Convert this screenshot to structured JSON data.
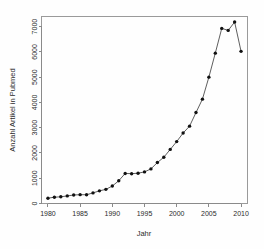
{
  "chart_data": {
    "type": "line",
    "title": "",
    "xlabel": "Jahr",
    "ylabel": "Anzahl Artikel in Pubmed",
    "xlim": [
      1979,
      2011
    ],
    "ylim": [
      0,
      7400
    ],
    "xticks": [
      1980,
      1985,
      1990,
      1995,
      2000,
      2005,
      2010
    ],
    "yticks": [
      0,
      1000,
      2000,
      3000,
      4000,
      5000,
      6000,
      7000
    ],
    "xtick_labels": [
      "1980",
      "1985",
      "1990",
      "1995",
      "2000",
      "2005",
      "2010"
    ],
    "ytick_labels": [
      "0",
      "1000",
      "2000",
      "3000",
      "4000",
      "5000",
      "6000",
      "7000"
    ],
    "grid": false,
    "legend": "none",
    "marker": "filled-circle",
    "line_color": "#1a1a1a",
    "point_color": "#111111",
    "x": [
      1980,
      1981,
      1982,
      1983,
      1984,
      1985,
      1986,
      1987,
      1988,
      1989,
      1990,
      1991,
      1992,
      1993,
      1994,
      1995,
      1996,
      1997,
      1998,
      1999,
      2000,
      2001,
      2002,
      2003,
      2004,
      2005,
      2006,
      2007,
      2008,
      2009,
      2010
    ],
    "values": [
      210,
      250,
      265,
      300,
      335,
      350,
      345,
      420,
      500,
      560,
      690,
      900,
      1190,
      1180,
      1200,
      1250,
      1370,
      1620,
      1830,
      2140,
      2450,
      2790,
      3060,
      3600,
      4130,
      5000,
      5950,
      6930,
      6850,
      7180,
      6020
    ],
    "series": [
      {
        "name": "Anzahl Artikel in Pubmed",
        "values": [
          210,
          250,
          265,
          300,
          335,
          350,
          345,
          420,
          500,
          560,
          690,
          900,
          1190,
          1180,
          1200,
          1250,
          1370,
          1620,
          1830,
          2140,
          2450,
          2790,
          3060,
          3600,
          4130,
          5000,
          5950,
          6930,
          6850,
          7180,
          6020
        ]
      }
    ]
  },
  "axes": {
    "x_title": "Jahr",
    "y_title": "Anzahl Artikel in Pubmed"
  }
}
